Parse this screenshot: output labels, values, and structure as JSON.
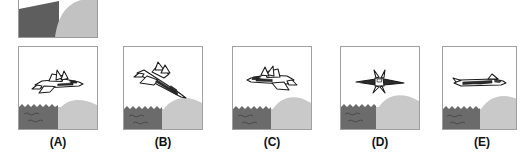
{
  "figure": {
    "kind": "multiple-choice-diagram",
    "option_count": 5,
    "colors": {
      "water": "#6b6b6b",
      "land": "#c9c9c9",
      "sky": "#ffffff",
      "outline": "#1a1a1a",
      "frame_border": "#a0a0a0",
      "label_text": "#111111",
      "reference_dark": "#5e5e5e",
      "reference_light": "#c2c2c2"
    }
  },
  "reference_panel": {
    "name": "reference-scene-cropped",
    "description": "partially cropped panel showing dark diagonal wedge on the left and a light curved hill on the right",
    "visible": true
  },
  "scene": {
    "water_label": "water",
    "land_label": "hill",
    "wave_marks": 4,
    "wave_squiggles": 2
  },
  "options": [
    {
      "id": "a",
      "label": "(A)",
      "jet_name": "jet-three-quarter-from-above-right",
      "orientation": "nose toward lower-right, viewed from above and behind, twin tails visible",
      "icon": "jet-icon"
    },
    {
      "id": "b",
      "label": "(B)",
      "jet_name": "jet-banking-diagonal-down-right",
      "orientation": "banked steeply, nose pointing down-right along a diagonal",
      "icon": "jet-icon"
    },
    {
      "id": "c",
      "label": "(C)",
      "jet_name": "jet-three-quarter-facing-left",
      "orientation": "mirrored view, nose toward the left, viewed from above",
      "icon": "jet-icon"
    },
    {
      "id": "d",
      "label": "(D)",
      "jet_name": "jet-head-on-foreshortened",
      "orientation": "nearly head-on, wings spread wide horizontally, heavily foreshortened fuselage",
      "icon": "jet-icon"
    },
    {
      "id": "e",
      "label": "(E)",
      "jet_name": "jet-flat-side-profile",
      "orientation": "flat side-on profile, nose to the right, level flight",
      "icon": "jet-icon"
    }
  ]
}
